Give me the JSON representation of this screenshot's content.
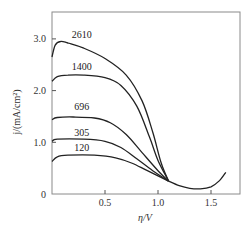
{
  "chart_data": {
    "type": "line",
    "title": "",
    "xlabel": "η/V",
    "ylabel": "j/(mA/cm²)",
    "xlim": [
      0,
      1.78
    ],
    "ylim": [
      0,
      3.5
    ],
    "grid": false,
    "legend_position": "inline labels",
    "x_ticks": [
      0.5,
      1.0,
      1.5
    ],
    "x_tick_labels": [
      "0.5",
      "1.0",
      "1.5"
    ],
    "y_ticks": [
      0,
      1.0,
      2.0,
      3.0
    ],
    "y_tick_labels": [
      "0",
      "1.0",
      "2.0",
      "3.0"
    ],
    "series": [
      {
        "name": "2610",
        "x": [
          0.0,
          0.03,
          0.08,
          0.15,
          0.3,
          0.5,
          0.7,
          0.85,
          0.95,
          1.03,
          1.1
        ],
        "y": [
          2.65,
          2.88,
          2.95,
          2.92,
          2.82,
          2.62,
          2.3,
          1.8,
          1.2,
          0.6,
          0.25
        ],
        "label_position": {
          "x": 0.28,
          "y": 3.02
        }
      },
      {
        "name": "1400",
        "x": [
          0.0,
          0.05,
          0.15,
          0.3,
          0.5,
          0.65,
          0.8,
          0.92,
          1.0,
          1.1
        ],
        "y": [
          2.18,
          2.27,
          2.3,
          2.3,
          2.25,
          2.1,
          1.7,
          1.1,
          0.65,
          0.25
        ],
        "label_position": {
          "x": 0.28,
          "y": 2.4
        }
      },
      {
        "name": "696",
        "x": [
          0.0,
          0.05,
          0.2,
          0.4,
          0.55,
          0.7,
          0.85,
          1.0,
          1.1
        ],
        "y": [
          1.44,
          1.48,
          1.49,
          1.47,
          1.38,
          1.15,
          0.8,
          0.45,
          0.25
        ],
        "label_position": {
          "x": 0.28,
          "y": 1.62
        }
      },
      {
        "name": "305",
        "x": [
          0.0,
          0.05,
          0.3,
          0.5,
          0.65,
          0.8,
          0.95,
          1.1
        ],
        "y": [
          1.02,
          1.06,
          1.06,
          1.02,
          0.9,
          0.68,
          0.45,
          0.25
        ],
        "label_position": {
          "x": 0.28,
          "y": 1.13
        }
      },
      {
        "name": "120",
        "x": [
          0.0,
          0.05,
          0.15,
          0.4,
          0.6,
          0.75,
          0.9,
          1.1
        ],
        "y": [
          0.63,
          0.72,
          0.75,
          0.75,
          0.7,
          0.6,
          0.45,
          0.25
        ],
        "label_position": {
          "x": 0.28,
          "y": 0.84
        }
      },
      {
        "name": "common tail",
        "x": [
          1.1,
          1.2,
          1.3,
          1.4,
          1.5,
          1.58,
          1.64
        ],
        "y": [
          0.25,
          0.16,
          0.11,
          0.1,
          0.14,
          0.26,
          0.42
        ]
      }
    ]
  },
  "labels": {
    "curve_labels": [
      "2610",
      "1400",
      "696",
      "305",
      "120"
    ],
    "x_ticks": [
      "0.5",
      "1.0",
      "1.5"
    ],
    "y_ticks": [
      "0",
      "1.0",
      "2.0",
      "3.0"
    ],
    "xlabel": "η/V",
    "ylabel": "j/(mA/cm²)"
  }
}
